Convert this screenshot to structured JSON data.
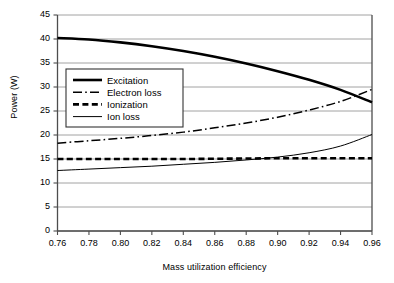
{
  "chart_data": {
    "type": "line",
    "title": "",
    "xlabel": "Mass utilization efficiency",
    "ylabel": "Power (W)",
    "xlim": [
      0.76,
      0.96
    ],
    "ylim": [
      0,
      45
    ],
    "xticks": [
      "0.76",
      "0.78",
      "0.80",
      "0.82",
      "0.84",
      "0.86",
      "0.88",
      "0.90",
      "0.92",
      "0.94",
      "0.96"
    ],
    "yticks": [
      "0",
      "5",
      "10",
      "15",
      "20",
      "25",
      "30",
      "35",
      "40",
      "45"
    ],
    "grid": "horizontal",
    "legend_position": "upper-left-inside",
    "x": [
      0.76,
      0.78,
      0.8,
      0.82,
      0.84,
      0.86,
      0.88,
      0.9,
      0.92,
      0.94,
      0.96
    ],
    "series": [
      {
        "name": "Excitation",
        "style": "solid-thick",
        "values": [
          40.2,
          39.9,
          39.3,
          38.5,
          37.5,
          36.3,
          34.9,
          33.3,
          31.5,
          29.4,
          26.8
        ]
      },
      {
        "name": "Electron loss",
        "style": "dash-dot",
        "values": [
          18.3,
          18.8,
          19.3,
          19.9,
          20.6,
          21.5,
          22.5,
          23.7,
          25.2,
          27.0,
          29.5
        ]
      },
      {
        "name": "Ionization",
        "style": "dashed-thick",
        "values": [
          15.0,
          15.0,
          15.0,
          15.0,
          15.0,
          15.05,
          15.1,
          15.15,
          15.15,
          15.15,
          15.15
        ]
      },
      {
        "name": "Ion loss",
        "style": "solid-thin",
        "values": [
          12.6,
          12.9,
          13.2,
          13.5,
          13.9,
          14.3,
          14.8,
          15.4,
          16.3,
          17.7,
          20.1
        ]
      }
    ]
  },
  "legend": {
    "items": [
      {
        "label": "Excitation"
      },
      {
        "label": "Electron loss"
      },
      {
        "label": "Ionization"
      },
      {
        "label": "Ion loss"
      }
    ]
  }
}
